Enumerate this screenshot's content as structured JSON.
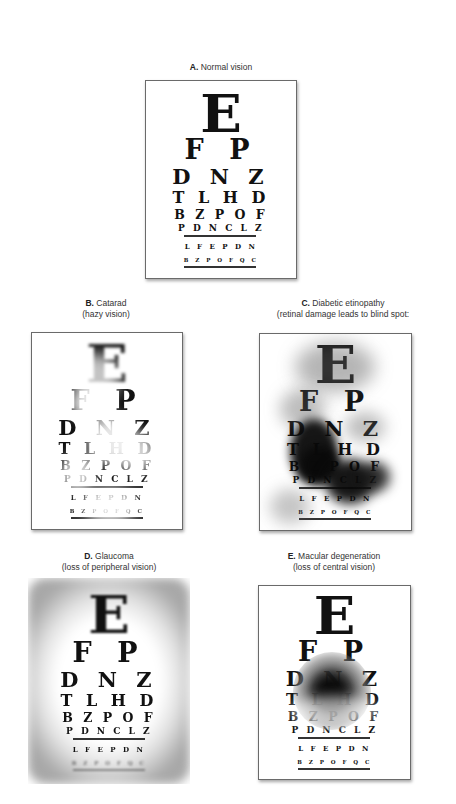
{
  "figure": {
    "letter_rows": [
      "E",
      "F P",
      "D N Z",
      "T L H D",
      "B Z P O F",
      "P D N C L Z",
      "L F E P D N",
      "B Z P O F Q C"
    ],
    "panels": [
      {
        "id": "A",
        "letter": "A.",
        "title": "Normal vision",
        "subtitle": ""
      },
      {
        "id": "B",
        "letter": "B.",
        "title": "Catarad",
        "subtitle": "(hazy vision)"
      },
      {
        "id": "C",
        "letter": "C.",
        "title": "Diabetic etinopathy",
        "subtitle": "(retinal damage leads to blind spot:"
      },
      {
        "id": "D",
        "letter": "D.",
        "title": "Glaucoma",
        "subtitle": "(loss of peripheral vision)"
      },
      {
        "id": "E",
        "letter": "E.",
        "title": "Macular degeneration",
        "subtitle": "(loss of central vision)"
      }
    ],
    "colors": {
      "ink": "#111111",
      "frame": "#6a6a6a",
      "background": "#ffffff"
    }
  }
}
